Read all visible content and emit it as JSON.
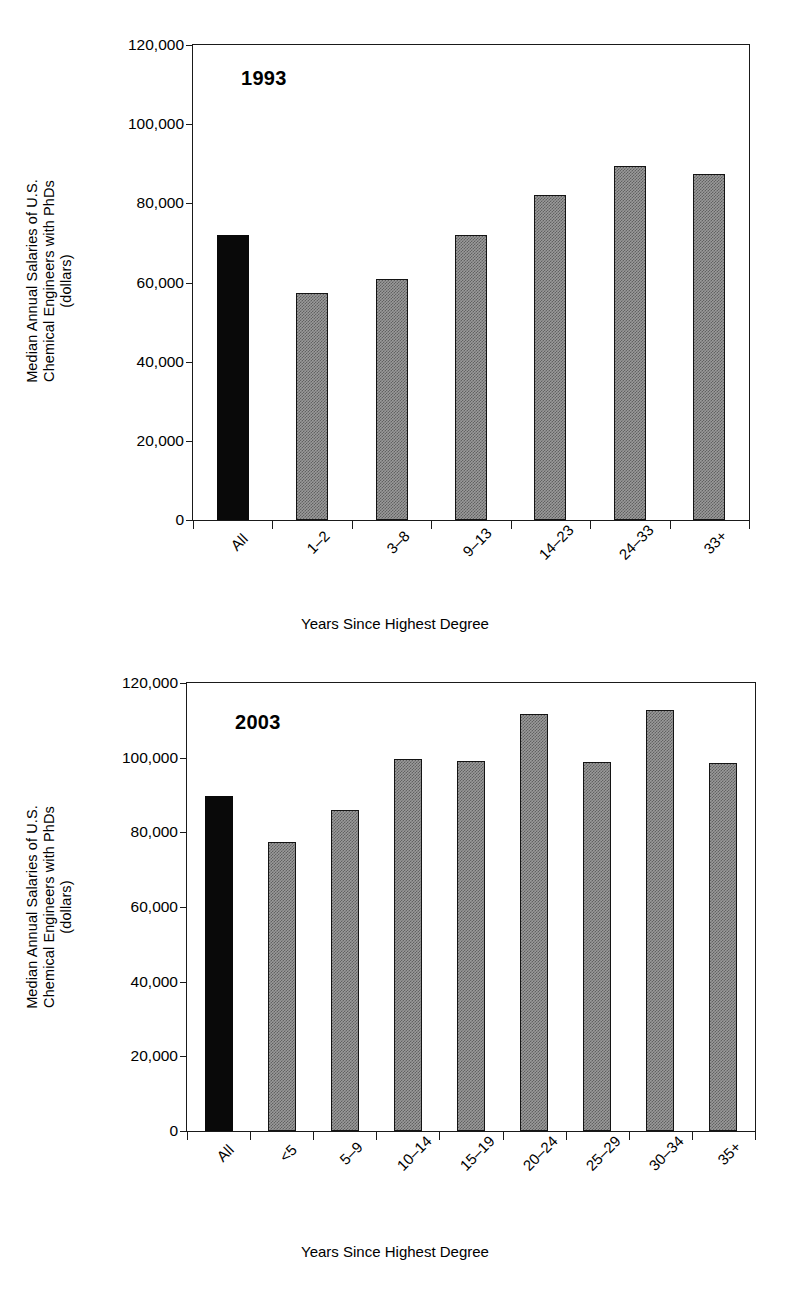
{
  "figure": {
    "axis_title_x": "Years Since Highest Degree",
    "axis_title_y_line1": "Median Annual Salaries of U.S.",
    "axis_title_y_line2": "Chemical Engineers with PhDs",
    "axis_title_y_line3": "(dollars)",
    "colors": {
      "highlight_bar": "#090909",
      "series_bar": "#9a9a9a",
      "axis": "#1a1a1a"
    }
  },
  "chart_data": [
    {
      "type": "bar",
      "title": "1993",
      "xlabel": "Years Since Highest Degree",
      "ylabel": "Median Annual Salaries of U.S. Chemical Engineers with PhDs (dollars)",
      "ylim": [
        0,
        120000
      ],
      "yticks": [
        0,
        20000,
        40000,
        60000,
        80000,
        100000,
        120000
      ],
      "ytick_labels": [
        "0",
        "20,000",
        "40,000",
        "60,000",
        "80,000",
        "100,000",
        "120,000"
      ],
      "grid": false,
      "legend": "none",
      "categories": [
        "All",
        "1–2",
        "3–8",
        "9–13",
        "14–23",
        "24–33",
        "33+"
      ],
      "values": [
        72000,
        57400,
        61000,
        72000,
        82000,
        89400,
        87500
      ],
      "highlight_index": 0
    },
    {
      "type": "bar",
      "title": "2003",
      "xlabel": "Years Since Highest Degree",
      "ylabel": "Median Annual Salaries of U.S. Chemical Engineers with PhDs (dollars)",
      "ylim": [
        0,
        120000
      ],
      "yticks": [
        0,
        20000,
        40000,
        60000,
        80000,
        100000,
        120000
      ],
      "ytick_labels": [
        "0",
        "20,000",
        "40,000",
        "60,000",
        "80,000",
        "100,000",
        "120,000"
      ],
      "grid": false,
      "legend": "none",
      "categories": [
        "All",
        "<5",
        "5–9",
        "10–14",
        "15–19",
        "20–24",
        "25–29",
        "30–34",
        "35+"
      ],
      "values": [
        89700,
        77500,
        86000,
        99700,
        99200,
        111600,
        98800,
        112800,
        98500
      ],
      "highlight_index": 0
    }
  ]
}
